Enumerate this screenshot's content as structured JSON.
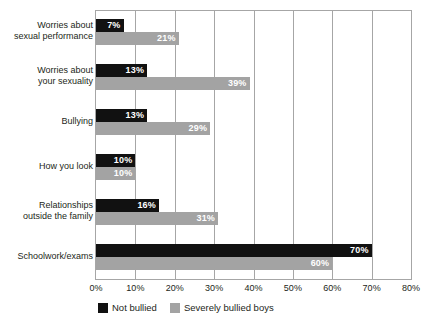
{
  "chart_data": {
    "type": "bar",
    "orientation": "horizontal",
    "title": "",
    "xlabel": "",
    "ylabel": "",
    "xlim": [
      0,
      80
    ],
    "xtick_labels": [
      "0%",
      "10%",
      "20%",
      "30%",
      "40%",
      "50%",
      "60%",
      "70%",
      "80%"
    ],
    "xtick_values": [
      0,
      10,
      20,
      30,
      40,
      50,
      60,
      70,
      80
    ],
    "grid": "vertical",
    "legend_position": "bottom-left",
    "categories": [
      "Worries about\nsexual performance",
      "Worries about\nyour sexuality",
      "Bullying",
      "How you look",
      "Relationships\noutside the family",
      "Schoolwork/exams"
    ],
    "series": [
      {
        "name": "Not bullied",
        "color": "#111111",
        "values": [
          7,
          13,
          13,
          10,
          16,
          70
        ],
        "labels": [
          "7%",
          "13%",
          "13%",
          "10%",
          "16%",
          "70%"
        ]
      },
      {
        "name": "Severely bullied boys",
        "color": "#a3a3a3",
        "values": [
          21,
          39,
          29,
          10,
          31,
          60
        ],
        "labels": [
          "21%",
          "39%",
          "29%",
          "10%",
          "31%",
          "60%"
        ]
      }
    ]
  },
  "legend": {
    "items": [
      {
        "label": "Not bullied",
        "swatch": "black"
      },
      {
        "label": "Severely bullied boys",
        "swatch": "gray"
      }
    ]
  }
}
